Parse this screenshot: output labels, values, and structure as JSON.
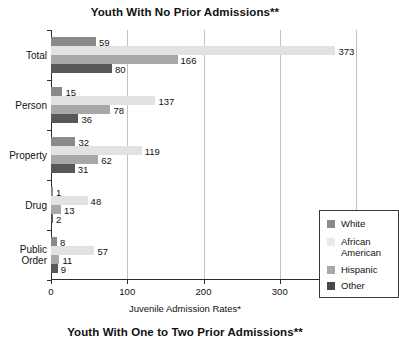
{
  "titles": {
    "top": "Youth With No Prior Admissions**",
    "bottom": "Youth With One to Two Prior Admissions**"
  },
  "axis": {
    "xlabel": "Juvenile Admission Rates*",
    "xticks": [
      "0",
      "100",
      "200",
      "300",
      "400"
    ]
  },
  "legend": {
    "items": [
      {
        "label": "White",
        "color": "#8a8a8a"
      },
      {
        "label": "African\nAmerican",
        "color": "#e8e8e8"
      },
      {
        "label": "Hispanic",
        "color": "#a8a8a8"
      },
      {
        "label": "Other",
        "color": "#484848"
      }
    ]
  },
  "chart_data": {
    "type": "bar",
    "orientation": "horizontal",
    "title": "Youth With No Prior Admissions**",
    "xlabel": "Juvenile Admission Rates*",
    "ylabel": "",
    "xlim": [
      0,
      400
    ],
    "xticks": [
      0,
      100,
      200,
      300,
      400
    ],
    "grid": "vertical",
    "legend_position": "inside-right",
    "categories": [
      "Total",
      "Person",
      "Property",
      "Drug",
      "Public Order"
    ],
    "series": [
      {
        "name": "White",
        "color": "#8a8a8a",
        "values": [
          59,
          15,
          32,
          1,
          8
        ]
      },
      {
        "name": "African American",
        "color": "#e2e2e2",
        "values": [
          373,
          137,
          119,
          48,
          57
        ]
      },
      {
        "name": "Hispanic",
        "color": "#a8a8a8",
        "values": [
          166,
          78,
          62,
          13,
          11
        ]
      },
      {
        "name": "Other",
        "color": "#585858",
        "values": [
          80,
          36,
          31,
          2,
          9
        ]
      }
    ],
    "data_labels": {
      "Total": {
        "White": "59",
        "African American": "373",
        "Hispanic": "166",
        "Other": "80"
      },
      "Person": {
        "White": "15",
        "African American": "137",
        "Hispanic": "78",
        "Other": "36"
      },
      "Property": {
        "White": "32",
        "African American": "119",
        "Hispanic": "62",
        "Other": "31"
      },
      "Drug": {
        "White": "1",
        "African American": "48",
        "Hispanic": "13",
        "Other": "2"
      },
      "Public Order": {
        "White": "8",
        "African American": "57",
        "Hispanic": "11",
        "Other": "9"
      }
    }
  }
}
